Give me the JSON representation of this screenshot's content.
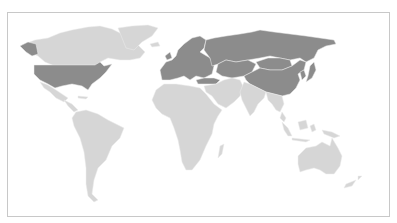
{
  "map": {
    "kind": "world choropleth",
    "legend": [],
    "colors": {
      "highlighted": "#8c8c8c",
      "other": "#d6d6d6",
      "background": "#ffffff",
      "frame": "#c8c8c8",
      "border": "#ececec"
    },
    "regions": [
      {
        "name": "Canada",
        "group": "other"
      },
      {
        "name": "Alaska",
        "group": "highlighted"
      },
      {
        "name": "Greenland",
        "group": "other"
      },
      {
        "name": "United States",
        "group": "highlighted"
      },
      {
        "name": "Mexico",
        "group": "other"
      },
      {
        "name": "Central America & Caribbean",
        "group": "other"
      },
      {
        "name": "South America",
        "group": "other"
      },
      {
        "name": "Iceland",
        "group": "other"
      },
      {
        "name": "Europe",
        "group": "highlighted"
      },
      {
        "name": "Russia",
        "group": "highlighted"
      },
      {
        "name": "Turkey",
        "group": "highlighted"
      },
      {
        "name": "Central Asia",
        "group": "highlighted"
      },
      {
        "name": "Mongolia",
        "group": "highlighted"
      },
      {
        "name": "China",
        "group": "highlighted"
      },
      {
        "name": "Korea",
        "group": "highlighted"
      },
      {
        "name": "Japan",
        "group": "highlighted"
      },
      {
        "name": "Africa",
        "group": "other"
      },
      {
        "name": "Madagascar",
        "group": "other"
      },
      {
        "name": "Middle East",
        "group": "other"
      },
      {
        "name": "South Asia",
        "group": "other"
      },
      {
        "name": "Southeast Asia",
        "group": "other"
      },
      {
        "name": "Indonesia",
        "group": "other"
      },
      {
        "name": "Papua New Guinea",
        "group": "other"
      },
      {
        "name": "Australia",
        "group": "other"
      },
      {
        "name": "New Zealand",
        "group": "other"
      }
    ]
  }
}
